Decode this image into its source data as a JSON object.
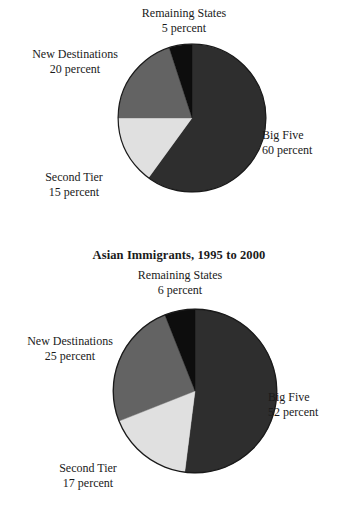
{
  "page": {
    "background": "#ffffff",
    "palette": {
      "big_five": "#2e2e2e",
      "second_tier": "#e0e0e0",
      "new_destinations": "#636363",
      "remaining_states": "#0d0d0d",
      "outline": "#1a1a1a",
      "text": "#1a1a1a"
    }
  },
  "figures": [
    {
      "id": "top",
      "title": "",
      "chart_data": {
        "type": "pie",
        "title": "",
        "xlabel": "",
        "ylabel": "",
        "legend": "none",
        "grid": false,
        "units": "percent",
        "start_angle_deg": 0,
        "direction": "clockwise",
        "categories": [
          "Big Five",
          "Second Tier",
          "New Destinations",
          "Remaining States"
        ],
        "values": [
          60,
          15,
          20,
          5
        ],
        "slices": [
          {
            "label": "Big Five",
            "value": 60,
            "value_text": "60 percent",
            "color": "#2e2e2e"
          },
          {
            "label": "Second Tier",
            "value": 15,
            "value_text": "15 percent",
            "color": "#e0e0e0"
          },
          {
            "label": "New Destinations",
            "value": 20,
            "value_text": "20 percent",
            "color": "#636363"
          },
          {
            "label": "Remaining States",
            "value": 5,
            "value_text": "5 percent",
            "color": "#0d0d0d"
          }
        ]
      }
    },
    {
      "id": "bottom",
      "title": "Asian Immigrants, 1995 to 2000",
      "chart_data": {
        "type": "pie",
        "title": "Asian Immigrants, 1995 to 2000",
        "xlabel": "",
        "ylabel": "",
        "legend": "none",
        "grid": false,
        "units": "percent",
        "start_angle_deg": 0,
        "direction": "clockwise",
        "categories": [
          "Big Five",
          "Second Tier",
          "New Destinations",
          "Remaining States"
        ],
        "values": [
          52,
          17,
          25,
          6
        ],
        "slices": [
          {
            "label": "Big Five",
            "value": 52,
            "value_text": "52 percent",
            "color": "#2e2e2e"
          },
          {
            "label": "Second Tier",
            "value": 17,
            "value_text": "17 percent",
            "color": "#e0e0e0"
          },
          {
            "label": "New Destinations",
            "value": 25,
            "value_text": "25 percent",
            "color": "#636363"
          },
          {
            "label": "Remaining States",
            "value": 6,
            "value_text": "6 percent",
            "color": "#0d0d0d"
          }
        ]
      }
    }
  ]
}
